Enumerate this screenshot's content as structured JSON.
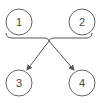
{
  "diagram": {
    "nodes": [
      {
        "id": "n1",
        "label": "1"
      },
      {
        "id": "n2",
        "label": "2"
      },
      {
        "id": "n3",
        "label": "3"
      },
      {
        "id": "n4",
        "label": "4"
      }
    ],
    "edges": [
      {
        "from": [
          "n1",
          "n2"
        ],
        "to": "n3",
        "type": "merge-arrow"
      },
      {
        "from": [
          "n1",
          "n2"
        ],
        "to": "n4",
        "type": "merge-arrow"
      }
    ],
    "colors": {
      "stroke": "#555555",
      "background": "#ffffff"
    }
  }
}
